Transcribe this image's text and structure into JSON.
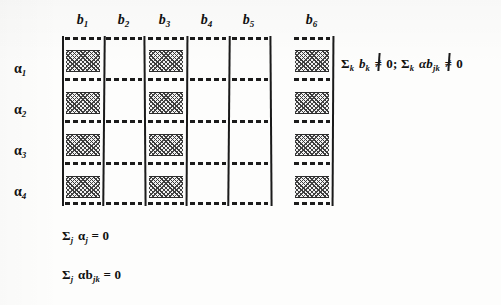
{
  "figure": {
    "type": "anova-effects-grid-diagram",
    "columns": [
      {
        "label": "b",
        "subscript": "1",
        "shaded": true
      },
      {
        "label": "b",
        "subscript": "2",
        "shaded": false
      },
      {
        "label": "b",
        "subscript": "3",
        "shaded": true
      },
      {
        "label": "b",
        "subscript": "4",
        "shaded": false
      },
      {
        "label": "b",
        "subscript": "5",
        "shaded": false
      },
      {
        "label": "b",
        "subscript": "6",
        "shaded": true
      }
    ],
    "rows": [
      {
        "label": "α",
        "subscript": "1"
      },
      {
        "label": "α",
        "subscript": "2"
      },
      {
        "label": "α",
        "subscript": "3"
      },
      {
        "label": "α",
        "subscript": "4"
      }
    ],
    "cells": [
      [
        true,
        false,
        true,
        false,
        false,
        true
      ],
      [
        true,
        false,
        true,
        false,
        false,
        true
      ],
      [
        true,
        false,
        true,
        false,
        false,
        true
      ],
      [
        true,
        false,
        true,
        false,
        false,
        true
      ]
    ],
    "annotations": {
      "right": {
        "full_text": "Σk bk ≠ 0; Σk αbjk ≠ 0",
        "part1": {
          "sigma": "Σ",
          "sigma_sub": "k",
          "term": "b",
          "term_sub": "k",
          "relation": "≠",
          "value": "0"
        },
        "separator": ";",
        "part2": {
          "sigma": "Σ",
          "sigma_sub": "k",
          "term": "αb",
          "term_sub": "jk",
          "relation": "≠",
          "value": "0"
        }
      },
      "bottom_1": {
        "full_text": "Σj αj = 0",
        "sigma": "Σ",
        "sigma_sub": "j",
        "term": "α",
        "term_sub": "j",
        "relation": "=",
        "value": "0"
      },
      "bottom_2": {
        "full_text": "Σj αbjk = 0",
        "sigma": "Σ",
        "sigma_sub": "j",
        "term": "αb",
        "term_sub": "jk",
        "relation": "=",
        "value": "0"
      }
    },
    "colors": {
      "ink": "#1b1b1b",
      "paper": "#fdfdfc",
      "bar_fill": "#f2f2f2"
    }
  }
}
